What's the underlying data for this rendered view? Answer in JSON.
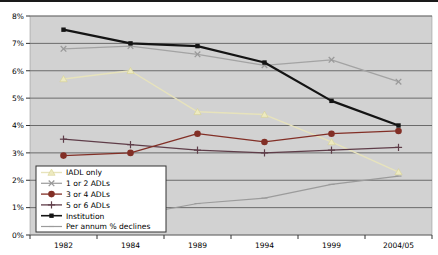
{
  "chart_data": {
    "type": "line",
    "title": "",
    "xlabel": "",
    "ylabel": "",
    "categories": [
      "1982",
      "1984",
      "1989",
      "1994",
      "1999",
      "2004/05"
    ],
    "y_ticks": [
      "0%",
      "1%",
      "2%",
      "3%",
      "4%",
      "5%",
      "6%",
      "7%",
      "8%"
    ],
    "ylim": [
      0,
      8
    ],
    "grid": "horizontal",
    "legend_position": "bottom-left-inside",
    "plot_bg": "#d2d2d2",
    "grid_color": "#6b6b6b",
    "axis_text_color": "#000000",
    "legend_bg": "#ffffff",
    "legend_border": "#333333",
    "series": [
      {
        "name": "IADL only",
        "marker": "triangle",
        "color": "#e7e3bc",
        "marker_color": "#edeac0",
        "width": 1.4,
        "values": [
          5.7,
          6.0,
          4.5,
          4.4,
          3.4,
          2.3
        ]
      },
      {
        "name": "1 or 2 ADLs",
        "marker": "x",
        "color": "#a3a3a3",
        "marker_color": "#9a9a9a",
        "width": 1.3,
        "values": [
          6.8,
          6.9,
          6.6,
          6.2,
          6.4,
          5.6
        ]
      },
      {
        "name": "3 or 4 ADLs",
        "marker": "circle",
        "color": "#822f26",
        "marker_color": "#822f26",
        "width": 1.3,
        "values": [
          2.9,
          3.0,
          3.7,
          3.4,
          3.7,
          3.8
        ]
      },
      {
        "name": "5 or 6 ADLs",
        "marker": "plus",
        "color": "#5f3d49",
        "marker_color": "#5f3d49",
        "width": 1.3,
        "values": [
          3.5,
          3.3,
          3.1,
          3.0,
          3.1,
          3.2
        ]
      },
      {
        "name": "Institution",
        "marker": "square",
        "color": "#141414",
        "marker_color": "#141414",
        "width": 2.2,
        "values": [
          7.5,
          7.0,
          6.9,
          6.3,
          4.9,
          4.0
        ]
      },
      {
        "name": "Per annum % declines",
        "marker": "dash",
        "color": "#9b9b9b",
        "marker_color": "#9b9b9b",
        "width": 1.2,
        "values": [
          null,
          0.7,
          1.15,
          1.35,
          1.85,
          2.15
        ]
      }
    ]
  }
}
